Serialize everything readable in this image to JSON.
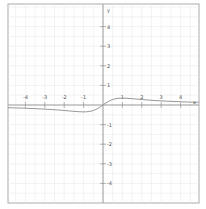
{
  "chart_data": {
    "type": "line",
    "title": "",
    "xlabel": "x",
    "ylabel": "y",
    "xlim": [
      -4.9,
      5.0
    ],
    "ylim": [
      -5.1,
      5.1
    ],
    "grid": true,
    "grid_step": 0.5,
    "x_ticks": [
      -4,
      -3,
      -2,
      -1,
      1,
      2,
      3,
      4
    ],
    "y_ticks": [
      4,
      3,
      2,
      1,
      -1,
      -2,
      -3,
      -4
    ],
    "x_tick_labels": [
      "-4",
      "-3",
      "-2",
      "-1",
      "1",
      "2",
      "3",
      "4"
    ],
    "y_tick_labels": [
      "4",
      "3",
      "2",
      "1",
      "-1",
      "-2",
      "-3",
      "-4"
    ],
    "series": [
      {
        "name": "f(x)",
        "color": "#999999",
        "x": [
          -4.9,
          -4,
          -3,
          -2,
          -1.5,
          -1,
          -0.5,
          0,
          0.5,
          1,
          1.3,
          1.5,
          2,
          3,
          4,
          5
        ],
        "y": [
          -0.14,
          -0.16,
          -0.21,
          -0.28,
          -0.32,
          -0.35,
          -0.28,
          0,
          0.28,
          0.35,
          0.35,
          0.32,
          0.28,
          0.21,
          0.16,
          0.13
        ]
      }
    ]
  },
  "axes": {
    "x_axis_label": "x",
    "y_axis_label": "y"
  },
  "colors": {
    "background": "#ffffff",
    "grid": "#e6e6e6",
    "axis": "#888888",
    "border": "#999999",
    "curve": "#999999"
  }
}
